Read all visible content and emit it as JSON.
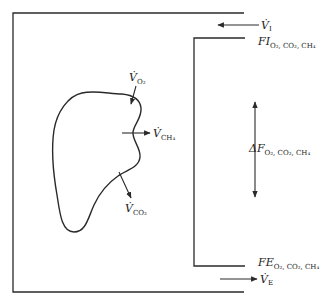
{
  "diagram": {
    "title": "",
    "colors": {
      "line": "#2a2a2a",
      "background": "#ffffff"
    },
    "labels": {
      "v_o2": {
        "main": "V̇",
        "sub": "O₂"
      },
      "v_ch4": {
        "main": "V̇",
        "sub": "CH₄"
      },
      "v_co2": {
        "main": "V̇",
        "sub": "CO₂"
      },
      "v_i": {
        "main": "V̇",
        "sub": "I"
      },
      "v_e": {
        "main": "V̇",
        "sub": "E"
      },
      "f_i": {
        "main": "FI",
        "sub": "O₂, CO₂, CH₄"
      },
      "f_e": {
        "main": "FE",
        "sub": "O₂, CO₂, CH₄"
      },
      "delta_f": {
        "main": "ΔF",
        "sub": "O₂, CO₂, CH₄"
      }
    },
    "components": [
      {
        "id": "chamber",
        "description": "outer chamber box"
      },
      {
        "id": "flow-channel",
        "description": "inner flow channel (inlet top, outlet bottom)"
      },
      {
        "id": "animal",
        "description": "irregular body outline with gas exchange arrows"
      }
    ],
    "arrows": [
      {
        "id": "inflow",
        "label": "V̇I",
        "direction": "left"
      },
      {
        "id": "outflow",
        "label": "V̇E",
        "direction": "right"
      },
      {
        "id": "o2-uptake",
        "label": "V̇O₂",
        "direction": "into body"
      },
      {
        "id": "ch4-release",
        "label": "V̇CH₄",
        "direction": "out of body"
      },
      {
        "id": "co2-release",
        "label": "V̇CO₂",
        "direction": "out of body"
      },
      {
        "id": "concentration-difference",
        "label": "ΔF",
        "direction": "bidirectional vertical"
      }
    ]
  }
}
